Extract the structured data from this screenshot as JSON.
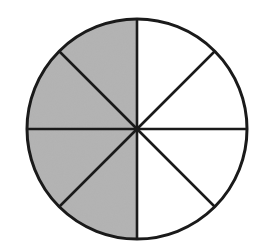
{
  "figure": {
    "title": "Circle divided into 8 equal parts with 4 parts shaded",
    "fraction_label": "4/8",
    "total_parts": 8,
    "shaded_parts": 4,
    "shaded_side": "left",
    "center": [
      137,
      129
    ],
    "radius": 110,
    "colors": {
      "background": "#ffffff",
      "shaded_fill": "#b2b2b2",
      "unshaded_fill": "#ffffff",
      "stroke": "#1a1a1a"
    },
    "stroke_width": 2.6
  },
  "chart_data": {
    "type": "pie",
    "title": "",
    "categories": [
      "sector-1",
      "sector-2",
      "sector-3",
      "sector-4",
      "sector-5",
      "sector-6",
      "sector-7",
      "sector-8"
    ],
    "values": [
      1,
      1,
      1,
      1,
      1,
      1,
      1,
      1
    ],
    "shaded": [
      false,
      false,
      false,
      false,
      true,
      true,
      true,
      true
    ],
    "shaded_fraction": "4/8",
    "legend": []
  }
}
